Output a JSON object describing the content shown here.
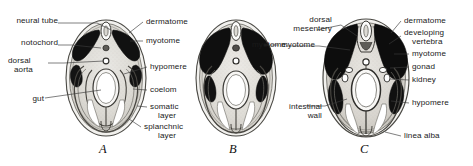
{
  "figure": {
    "background_color": "#ffffff",
    "text_color": "#1a1a1a",
    "leader_line_color": "#3a3a3a"
  },
  "panels": [
    {
      "letter": "A",
      "letter_x": 102,
      "letter_y": 145,
      "center_x": 106,
      "center_y": 78,
      "rx": 40,
      "ry": 58,
      "labels_left": [
        {
          "text": "neural tube",
          "x": 58,
          "y": 20,
          "tip_x": 99,
          "tip_y": 27
        },
        {
          "text": "notochord",
          "x": 58,
          "y": 42,
          "tip_x": 100,
          "tip_y": 46
        },
        {
          "text": "dorsal",
          "x": 46,
          "y": 60,
          "tip_x": 104,
          "tip_y": 62
        },
        {
          "text": "aorta",
          "x": 44,
          "y": 69,
          "tip_x": 0,
          "tip_y": 0
        },
        {
          "text": "gut",
          "x": 30,
          "y": 98,
          "tip_x": 100,
          "tip_y": 95
        }
      ],
      "labels_right": [
        {
          "text": "dermatome",
          "x": 146,
          "y": 19,
          "tip_x": 130,
          "tip_y": 34
        },
        {
          "text": "myotome",
          "x": 146,
          "y": 38,
          "tip_x": 128,
          "tip_y": 41
        },
        {
          "text": "hypomere",
          "x": 150,
          "y": 64,
          "tip_x": 126,
          "tip_y": 73
        },
        {
          "text": "coelom",
          "x": 150,
          "y": 87,
          "tip_x": 132,
          "tip_y": 88
        },
        {
          "text": "somatic",
          "x": 150,
          "y": 104,
          "tip_x": 136,
          "tip_y": 106
        },
        {
          "text": "layer",
          "x": 150,
          "y": 113,
          "tip_x": 0,
          "tip_y": 0
        },
        {
          "text": "splanchnic",
          "x": 144,
          "y": 124,
          "tip_x": 131,
          "tip_y": 120
        },
        {
          "text": "layer",
          "x": 152,
          "y": 133,
          "tip_x": 0,
          "tip_y": 0
        }
      ]
    },
    {
      "letter": "B",
      "letter_x": 232,
      "letter_y": 145,
      "center_x": 236,
      "center_y": 78,
      "rx": 40,
      "ry": 58,
      "labels_left": [],
      "labels_right": [
        {
          "text": "myotome",
          "x": 282,
          "y": 42,
          "tip_x": 262,
          "tip_y": 44
        }
      ]
    },
    {
      "letter": "C",
      "letter_x": 363,
      "letter_y": 145,
      "center_x": 366,
      "center_y": 78,
      "rx": 43,
      "ry": 59,
      "labels_left": [
        {
          "text": "dorsal",
          "x": 316,
          "y": 18,
          "tip_x": 356,
          "tip_y": 34
        },
        {
          "text": "mesentery",
          "x": 302,
          "y": 27,
          "tip_x": 0,
          "tip_y": 0
        },
        {
          "text": "myotome",
          "x": 286,
          "y": 43,
          "tip_x": 345,
          "tip_y": 48
        },
        {
          "text": "intestinal",
          "x": 291,
          "y": 105,
          "tip_x": 344,
          "tip_y": 100
        },
        {
          "text": "wall",
          "x": 307,
          "y": 114,
          "tip_x": 0,
          "tip_y": 0
        }
      ],
      "labels_right": [
        {
          "text": "dermatome",
          "x": 404,
          "y": 18,
          "tip_x": 390,
          "tip_y": 33
        },
        {
          "text": "developing",
          "x": 404,
          "y": 30,
          "tip_x": 388,
          "tip_y": 42
        },
        {
          "text": "vertebra",
          "x": 412,
          "y": 39,
          "tip_x": 0,
          "tip_y": 0
        },
        {
          "text": "myotome",
          "x": 412,
          "y": 51,
          "tip_x": 392,
          "tip_y": 53
        },
        {
          "text": "gonad",
          "x": 412,
          "y": 64,
          "tip_x": 390,
          "tip_y": 66
        },
        {
          "text": "kidney",
          "x": 412,
          "y": 77,
          "tip_x": 390,
          "tip_y": 78
        },
        {
          "text": "hypomere",
          "x": 412,
          "y": 100,
          "tip_x": 391,
          "tip_y": 100
        },
        {
          "text": "linea alba",
          "x": 404,
          "y": 133,
          "tip_x": 386,
          "tip_y": 131
        }
      ]
    }
  ]
}
